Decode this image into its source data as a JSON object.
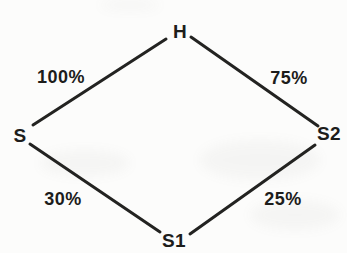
{
  "diagram": {
    "type": "node-link-diamond",
    "nodes": {
      "top": {
        "label": "H"
      },
      "left": {
        "label": "S"
      },
      "right": {
        "label": "S2"
      },
      "bottom": {
        "label": "S1"
      }
    },
    "edges": {
      "left_top": {
        "from": "S",
        "to": "H",
        "label": "100%"
      },
      "top_right": {
        "from": "H",
        "to": "S2",
        "label": "75%"
      },
      "left_bottom": {
        "from": "S",
        "to": "S1",
        "label": "30%"
      },
      "bottom_right": {
        "from": "S1",
        "to": "S2",
        "label": "25%"
      }
    },
    "colors": {
      "line": "#232321",
      "text": "#1d1d1b",
      "background": "#fcfcfb"
    }
  }
}
